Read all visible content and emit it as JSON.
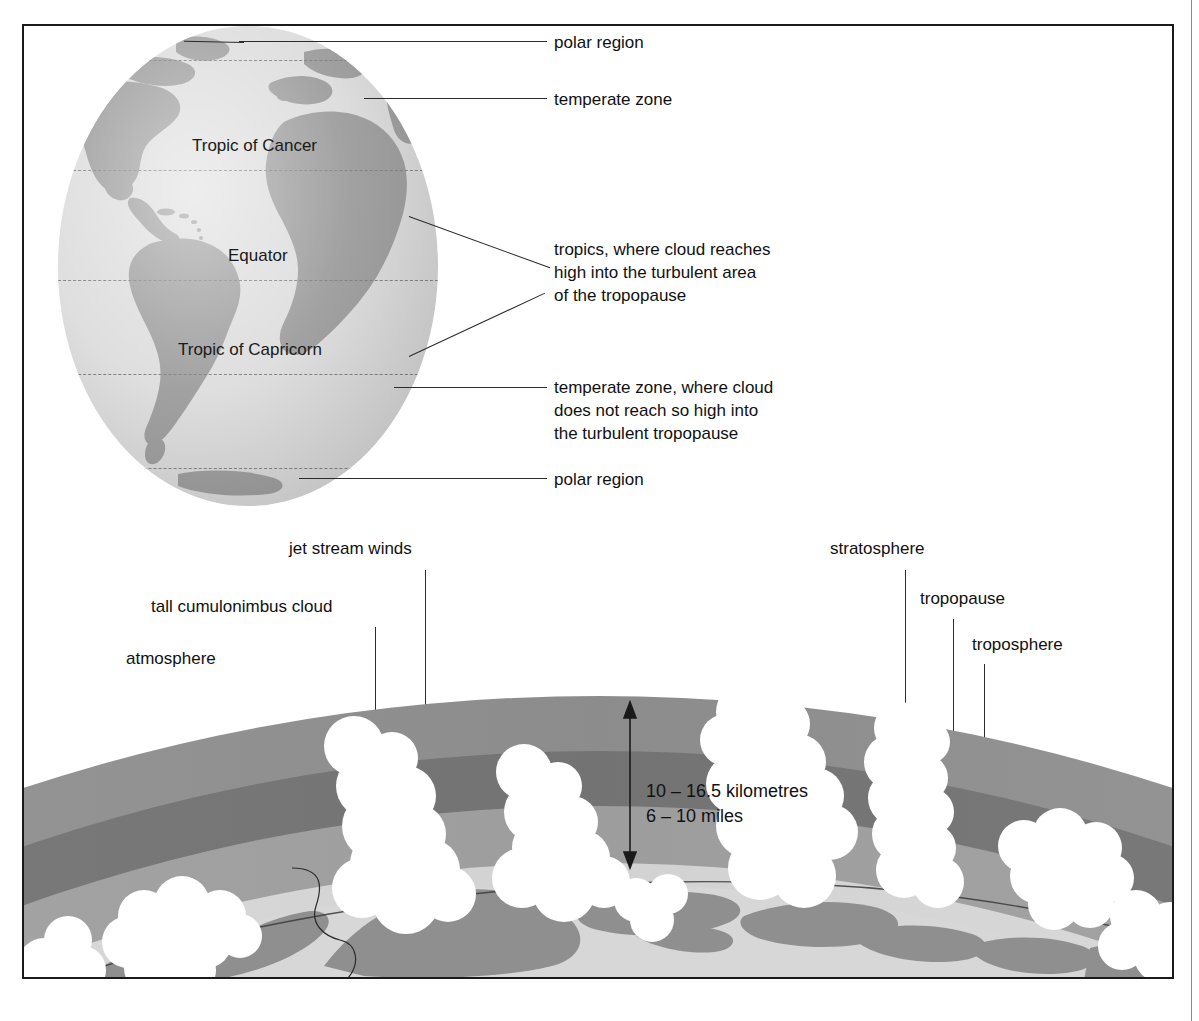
{
  "figure": {
    "kind": "scientific-diagram"
  },
  "globe": {
    "latitude_labels": [
      {
        "id": "tropic-of-cancer",
        "text": "Tropic of Cancer"
      },
      {
        "id": "equator",
        "text": "Equator"
      },
      {
        "id": "tropic-of-capricorn",
        "text": "Tropic of Capricorn"
      }
    ],
    "callouts": [
      {
        "id": "polar-region-north",
        "text": "polar region"
      },
      {
        "id": "temperate-zone-north",
        "text": "temperate zone"
      },
      {
        "id": "tropics",
        "text": "tropics, where cloud reaches\nhigh into the turbulent area\nof the tropopause"
      },
      {
        "id": "temperate-zone-south",
        "text": "temperate zone, where cloud\ndoes not reach so high into\nthe turbulent tropopause"
      },
      {
        "id": "polar-region-south",
        "text": "polar region"
      }
    ]
  },
  "atmosphere": {
    "labels": [
      {
        "id": "atmosphere",
        "text": "atmosphere"
      },
      {
        "id": "tall-cumulonimbus-cloud",
        "text": "tall cumulonimbus cloud"
      },
      {
        "id": "jet-stream-winds",
        "text": "jet stream winds"
      },
      {
        "id": "stratosphere",
        "text": "stratosphere"
      },
      {
        "id": "tropopause",
        "text": "tropopause"
      },
      {
        "id": "troposphere",
        "text": "troposphere"
      }
    ],
    "measurement": {
      "metric": "10 – 16.5 kilometres",
      "imperial": "6 – 10 miles",
      "combined": "10 – 16.5 kilometres\n6 – 10 miles"
    }
  },
  "colors": {
    "ocean": "#d9d9d9",
    "land": "#919191",
    "stratosphere_band": "#8f8f8f",
    "tropopause_band": "#777777",
    "troposphere_band": "#a3a3a3",
    "surface_halo": "#d3d3d3",
    "cloud": "#ffffff",
    "line": "#2b2b2b",
    "frame": "#1a1a1a",
    "text": "#111111"
  }
}
